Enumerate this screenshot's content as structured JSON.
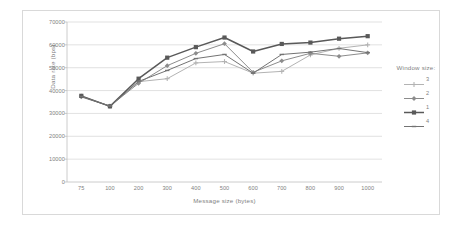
{
  "chart_data": {
    "type": "line",
    "title": "",
    "xlabel": "Message size (bytes)",
    "ylabel": "Data rate (bps)",
    "categories": [
      "75",
      "100",
      "200",
      "300",
      "400",
      "500",
      "600",
      "700",
      "800",
      "900",
      "1000"
    ],
    "ylim": [
      0,
      70000
    ],
    "yticks": [
      "0",
      "10000",
      "20000",
      "30000",
      "40000",
      "50000",
      "60000",
      "70000"
    ],
    "ytick_values": [
      0,
      10000,
      20000,
      30000,
      40000,
      50000,
      60000,
      70000
    ],
    "grid": "horizontal",
    "legend_position": "right",
    "legend_title": "Window size:",
    "series": [
      {
        "name": "3",
        "color": "#b3b3b3",
        "marker": "cross",
        "values": [
          37600,
          33200,
          43900,
          45200,
          52100,
          52700,
          47600,
          48400,
          55600,
          58500,
          60000
        ]
      },
      {
        "name": "2",
        "color": "#8c8c8c",
        "marker": "diamond",
        "values": [
          37200,
          33200,
          43200,
          50900,
          56300,
          60500,
          48000,
          53000,
          56300,
          55000,
          56500
        ]
      },
      {
        "name": "1",
        "color": "#595959",
        "marker": "square",
        "values": [
          37700,
          33100,
          45200,
          54400,
          59000,
          63200,
          57100,
          60400,
          61000,
          62700,
          63800
        ]
      },
      {
        "name": "4",
        "color": "#737373",
        "marker": "bar",
        "values": [
          37400,
          33200,
          44000,
          48800,
          54000,
          55800,
          47600,
          55800,
          56800,
          58400,
          56600
        ]
      }
    ]
  }
}
